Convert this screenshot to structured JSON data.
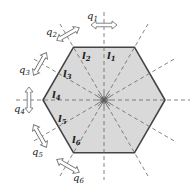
{
  "diagram": {
    "colors": {
      "hexagon_fill": "#d9d9d9",
      "hexagon_stroke": "#444444",
      "dashed_line": "#666666",
      "arrow_stroke": "#777777",
      "text": "#222222"
    },
    "center": {
      "x": 104,
      "y": 100
    },
    "radius": 61,
    "coordinates": [
      {
        "id": "q1",
        "label": "q",
        "sub": "1"
      },
      {
        "id": "q2",
        "label": "q",
        "sub": "2"
      },
      {
        "id": "q3",
        "label": "q",
        "sub": "3"
      },
      {
        "id": "q4",
        "label": "q",
        "sub": "4"
      },
      {
        "id": "q5",
        "label": "q",
        "sub": "5"
      },
      {
        "id": "q6",
        "label": "q",
        "sub": "6"
      }
    ],
    "lengths": [
      {
        "id": "l1",
        "label": "l",
        "sub": "1"
      },
      {
        "id": "l2",
        "label": "l",
        "sub": "2"
      },
      {
        "id": "l3",
        "label": "l",
        "sub": "3"
      },
      {
        "id": "l4",
        "label": "l",
        "sub": "4"
      },
      {
        "id": "l5",
        "label": "l",
        "sub": "5"
      },
      {
        "id": "l6",
        "label": "l",
        "sub": "6"
      }
    ]
  }
}
